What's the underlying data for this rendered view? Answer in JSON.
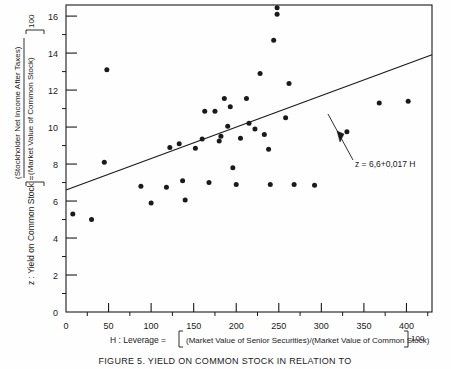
{
  "figure": {
    "caption": "FIGURE 5.     YIELD ON COMMON STOCK IN RELATION TO",
    "annotation": "z = 6,6+0,017 H",
    "background_color": "#fefefe",
    "ink_color": "#1a1a1a"
  },
  "chart_data": {
    "type": "scatter",
    "title": "",
    "xlabel": "H : Leverage = [(Market Value of Senior Securities)/(Market Value of Common Stock)] 100",
    "ylabel": "z : Yield on Common Stock = [(Stockholder Net Income After Taxes)/(Market Value of Common Stock)] 100",
    "xlabel_parts": {
      "lead": "H : Leverage =",
      "numerator": "(Market Value of Senior Securities)/(Market Value of Common Stock)",
      "multiplier": "100"
    },
    "ylabel_parts": {
      "lead": "z : Yield on Common Stock =",
      "numerator": "(Stockholder Net Income After Taxes)",
      "denominator": "(Market Value of Common Stock)",
      "multiplier": "100"
    },
    "xlim": [
      0,
      430
    ],
    "ylim": [
      0,
      16.6
    ],
    "x_ticks": [
      0,
      50,
      100,
      150,
      200,
      250,
      300,
      350,
      400
    ],
    "x_tick_labels": [
      "0",
      "50",
      "100",
      "150",
      "200",
      "250",
      "300",
      "350",
      "400"
    ],
    "x_minor_ticks": [
      25,
      75,
      125,
      175,
      225,
      275,
      325,
      375,
      425
    ],
    "y_ticks": [
      0,
      2,
      4,
      6,
      8,
      10,
      12,
      14,
      16
    ],
    "y_tick_labels": [
      "0",
      "2",
      "4",
      "6",
      "8",
      "10",
      "12",
      "14",
      "16"
    ],
    "y_minor_ticks": [
      1,
      3,
      5,
      7,
      9,
      11,
      13,
      15
    ],
    "grid": false,
    "legend": false,
    "marker": "filled-circle",
    "points": [
      {
        "x": 8,
        "y": 5.3
      },
      {
        "x": 30,
        "y": 5.0
      },
      {
        "x": 45,
        "y": 8.1
      },
      {
        "x": 48,
        "y": 13.1
      },
      {
        "x": 88,
        "y": 6.8
      },
      {
        "x": 100,
        "y": 5.9
      },
      {
        "x": 118,
        "y": 6.75
      },
      {
        "x": 122,
        "y": 8.9
      },
      {
        "x": 133,
        "y": 9.1
      },
      {
        "x": 137,
        "y": 7.1
      },
      {
        "x": 140,
        "y": 6.05
      },
      {
        "x": 152,
        "y": 8.85
      },
      {
        "x": 160,
        "y": 9.35
      },
      {
        "x": 163,
        "y": 10.85
      },
      {
        "x": 168,
        "y": 7.0
      },
      {
        "x": 175,
        "y": 10.85
      },
      {
        "x": 180,
        "y": 9.25
      },
      {
        "x": 182,
        "y": 9.5
      },
      {
        "x": 186,
        "y": 11.55
      },
      {
        "x": 190,
        "y": 10.05
      },
      {
        "x": 193,
        "y": 11.1
      },
      {
        "x": 196,
        "y": 7.8
      },
      {
        "x": 200,
        "y": 6.9
      },
      {
        "x": 205,
        "y": 9.4
      },
      {
        "x": 212,
        "y": 11.55
      },
      {
        "x": 215,
        "y": 10.2
      },
      {
        "x": 222,
        "y": 9.9
      },
      {
        "x": 228,
        "y": 12.9
      },
      {
        "x": 233,
        "y": 9.6
      },
      {
        "x": 238,
        "y": 8.8
      },
      {
        "x": 240,
        "y": 6.9
      },
      {
        "x": 244,
        "y": 14.7
      },
      {
        "x": 248,
        "y": 16.45
      },
      {
        "x": 248,
        "y": 16.1
      },
      {
        "x": 258,
        "y": 10.5
      },
      {
        "x": 262,
        "y": 12.35
      },
      {
        "x": 268,
        "y": 6.9
      },
      {
        "x": 292,
        "y": 6.85
      },
      {
        "x": 330,
        "y": 9.75
      },
      {
        "x": 368,
        "y": 11.3
      },
      {
        "x": 402,
        "y": 11.4
      }
    ],
    "fit_line": {
      "equation": "z = 6,6+0,017 H",
      "intercept": 6.6,
      "slope": 0.017,
      "x_start": 0,
      "x_end": 430
    }
  }
}
